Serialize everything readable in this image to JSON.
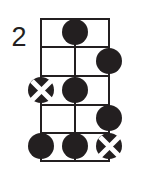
{
  "diagram": {
    "type": "guitar-chord-diagram",
    "fret_position_label": "2",
    "strings_shown": 3,
    "fret_spaces_shown": 5,
    "line_color": "#231f20",
    "marker_color": "#231f20",
    "cross_color": "#ffffff",
    "background_color": "#ffffff",
    "string_positions": [
      0,
      34,
      68
    ],
    "fret_line_positions": [
      0,
      28,
      57,
      86,
      114,
      142
    ],
    "markers": [
      {
        "name": "marker-fret1-string2",
        "kind": "filled",
        "string": 1,
        "fret_space": 1,
        "x": 34,
        "y": 14
      },
      {
        "name": "marker-fret2-string3",
        "kind": "filled",
        "string": 2,
        "fret_space": 2,
        "x": 68,
        "y": 43
      },
      {
        "name": "marker-fret3-string1",
        "kind": "crossed",
        "string": 0,
        "fret_space": 3,
        "x": 0,
        "y": 72
      },
      {
        "name": "marker-fret3-string2",
        "kind": "filled",
        "string": 1,
        "fret_space": 3,
        "x": 34,
        "y": 72
      },
      {
        "name": "marker-fret4-string3",
        "kind": "filled",
        "string": 2,
        "fret_space": 4,
        "x": 68,
        "y": 100
      },
      {
        "name": "marker-fret5-string1",
        "kind": "filled",
        "string": 0,
        "fret_space": 5,
        "x": 0,
        "y": 128
      },
      {
        "name": "marker-fret5-string2",
        "kind": "filled",
        "string": 1,
        "fret_space": 5,
        "x": 34,
        "y": 128
      },
      {
        "name": "marker-fret5-string3",
        "kind": "crossed",
        "string": 2,
        "fret_space": 5,
        "x": 68,
        "y": 128
      }
    ]
  }
}
